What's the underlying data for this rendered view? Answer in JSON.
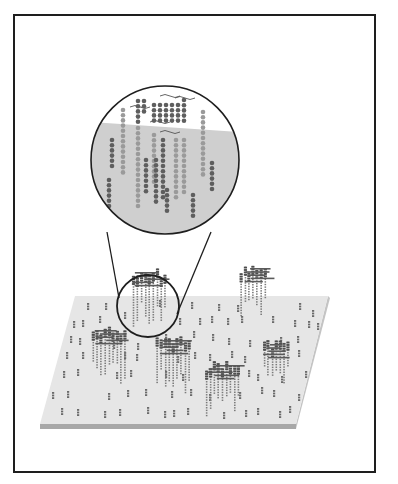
{
  "figure": {
    "title": "",
    "colors": {
      "frame": "#1e1e1e",
      "plate_top": "#e6e6e6",
      "plate_edge": "#a8a8a8",
      "plate_side": "#c4c4c4",
      "magnifier_fill_top": "#ffffff",
      "magnifier_fill_bottom": "#cfcfcf",
      "dot_light": "#9a9a9a",
      "dot_dark": "#5e5e5e",
      "probe": "#6a6a6a",
      "outline": "#1e1e1e"
    },
    "plate": {
      "top_face": [
        [
          75,
          296
        ],
        [
          328,
          296
        ],
        [
          296,
          424
        ],
        [
          40,
          424
        ]
      ],
      "thickness": 5
    },
    "magnifier": {
      "cx": 165,
      "cy": 160,
      "r": 74,
      "split_y": 122,
      "connector_lines": [
        [
          [
            107,
            232
          ],
          [
            119,
            298
          ]
        ],
        [
          [
            211,
            232
          ],
          [
            177,
            314
          ]
        ]
      ]
    },
    "focus_circle": {
      "cx": 148,
      "cy": 306,
      "r": 31
    },
    "magnified_columns": [
      {
        "x": 123,
        "y0": 110,
        "n": 13,
        "shade": "light"
      },
      {
        "x": 112,
        "y0": 140,
        "n": 6,
        "shade": "dark"
      },
      {
        "x": 109,
        "y0": 180,
        "n": 6,
        "shade": "dark"
      },
      {
        "x": 138,
        "y0": 101,
        "n": 5,
        "shade": "dark"
      },
      {
        "x": 144,
        "y0": 101,
        "n": 3,
        "shade": "dark"
      },
      {
        "x": 138,
        "y0": 128,
        "n": 16,
        "shade": "light"
      },
      {
        "x": 146,
        "y0": 160,
        "n": 7,
        "shade": "dark"
      },
      {
        "x": 154,
        "y0": 105,
        "n": 4,
        "shade": "dark"
      },
      {
        "x": 160,
        "y0": 105,
        "n": 4,
        "shade": "dark"
      },
      {
        "x": 166,
        "y0": 105,
        "n": 4,
        "shade": "dark"
      },
      {
        "x": 172,
        "y0": 105,
        "n": 4,
        "shade": "dark"
      },
      {
        "x": 178,
        "y0": 105,
        "n": 4,
        "shade": "dark"
      },
      {
        "x": 184,
        "y0": 100,
        "n": 5,
        "shade": "dark"
      },
      {
        "x": 154,
        "y0": 135,
        "n": 10,
        "shade": "light"
      },
      {
        "x": 156,
        "y0": 160,
        "n": 9,
        "shade": "dark"
      },
      {
        "x": 163,
        "y0": 140,
        "n": 12,
        "shade": "dark"
      },
      {
        "x": 167,
        "y0": 190,
        "n": 5,
        "shade": "dark"
      },
      {
        "x": 176,
        "y0": 140,
        "n": 12,
        "shade": "light"
      },
      {
        "x": 184,
        "y0": 140,
        "n": 11,
        "shade": "light"
      },
      {
        "x": 193,
        "y0": 195,
        "n": 5,
        "shade": "dark"
      },
      {
        "x": 203,
        "y0": 112,
        "n": 13,
        "shade": "light"
      },
      {
        "x": 212,
        "y0": 163,
        "n": 6,
        "shade": "dark"
      }
    ],
    "clusters": [
      {
        "x": 92,
        "y": 326,
        "w": 36,
        "h": 50
      },
      {
        "x": 156,
        "y": 336,
        "w": 36,
        "h": 52
      },
      {
        "x": 205,
        "y": 361,
        "w": 34,
        "h": 48
      },
      {
        "x": 263,
        "y": 340,
        "w": 28,
        "h": 44
      },
      {
        "x": 240,
        "y": 264,
        "w": 28,
        "h": 48
      },
      {
        "x": 132,
        "y": 268,
        "w": 36,
        "h": 52
      }
    ],
    "scattered_probes": [
      [
        88,
        303
      ],
      [
        106,
        303
      ],
      [
        160,
        300
      ],
      [
        192,
        302
      ],
      [
        219,
        304
      ],
      [
        238,
        305
      ],
      [
        300,
        303
      ],
      [
        313,
        310
      ],
      [
        74,
        321
      ],
      [
        83,
        320
      ],
      [
        100,
        316
      ],
      [
        125,
        312
      ],
      [
        180,
        318
      ],
      [
        200,
        318
      ],
      [
        212,
        316
      ],
      [
        228,
        318
      ],
      [
        242,
        316
      ],
      [
        273,
        316
      ],
      [
        295,
        320
      ],
      [
        309,
        321
      ],
      [
        318,
        323
      ],
      [
        71,
        336
      ],
      [
        80,
        338
      ],
      [
        114,
        342
      ],
      [
        138,
        343
      ],
      [
        166,
        334
      ],
      [
        194,
        331
      ],
      [
        213,
        334
      ],
      [
        229,
        338
      ],
      [
        250,
        340
      ],
      [
        281,
        337
      ],
      [
        298,
        336
      ],
      [
        67,
        352
      ],
      [
        83,
        352
      ],
      [
        125,
        352
      ],
      [
        137,
        354
      ],
      [
        178,
        356
      ],
      [
        195,
        352
      ],
      [
        210,
        354
      ],
      [
        232,
        351
      ],
      [
        245,
        356
      ],
      [
        299,
        350
      ],
      [
        64,
        371
      ],
      [
        78,
        369
      ],
      [
        117,
        372
      ],
      [
        131,
        370
      ],
      [
        166,
        371
      ],
      [
        183,
        374
      ],
      [
        249,
        370
      ],
      [
        258,
        374
      ],
      [
        282,
        376
      ],
      [
        306,
        371
      ],
      [
        53,
        392
      ],
      [
        68,
        391
      ],
      [
        109,
        393
      ],
      [
        128,
        390
      ],
      [
        146,
        389
      ],
      [
        172,
        391
      ],
      [
        191,
        389
      ],
      [
        210,
        394
      ],
      [
        240,
        392
      ],
      [
        262,
        387
      ],
      [
        274,
        390
      ],
      [
        299,
        394
      ],
      [
        62,
        408
      ],
      [
        78,
        409
      ],
      [
        105,
        411
      ],
      [
        120,
        409
      ],
      [
        148,
        407
      ],
      [
        165,
        411
      ],
      [
        174,
        410
      ],
      [
        188,
        408
      ],
      [
        224,
        412
      ],
      [
        246,
        410
      ],
      [
        258,
        408
      ],
      [
        280,
        411
      ],
      [
        290,
        406
      ]
    ]
  }
}
